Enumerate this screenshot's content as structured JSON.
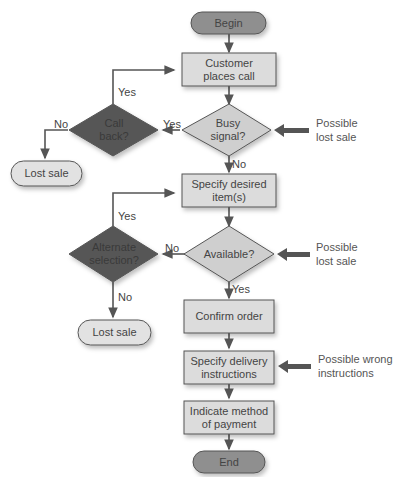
{
  "colors": {
    "terminal_fill": "#8f8f8f",
    "process_fill": "#dcdcdc",
    "light_diamond_fill": "#cfcfcf",
    "dark_diamond_fill": "#575757",
    "lost_sale_fill": "#e2e2e2",
    "line": "#555555"
  },
  "nodes": {
    "begin": "Begin",
    "customer_places_call": "Customer\nplaces call",
    "busy_signal": "Busy\nsignal?",
    "call_back": "Call\nback?",
    "lost_sale_1": "Lost sale",
    "specify_items": "Specify desired\nitem(s)",
    "available": "Available?",
    "alternate_selection": "Alternate\nselection?",
    "lost_sale_2": "Lost sale",
    "confirm_order": "Confirm order",
    "delivery_instructions": "Specify delivery\ninstructions",
    "payment": "Indicate method\nof payment",
    "end": "End"
  },
  "edges": {
    "busy_yes": "Yes",
    "busy_no": "No",
    "callback_yes": "Yes",
    "callback_no": "No",
    "available_no": "No",
    "available_yes": "Yes",
    "alternate_yes": "Yes",
    "alternate_no": "No"
  },
  "annotations": {
    "busy": "Possible\nlost sale",
    "available": "Possible\nlost sale",
    "delivery": "Possible wrong\ninstructions"
  }
}
